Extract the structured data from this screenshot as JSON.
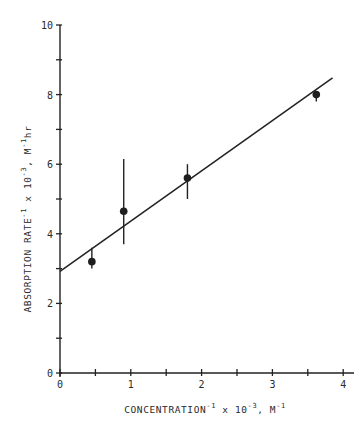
{
  "chart_data": {
    "type": "scatter",
    "title": "",
    "xlabel": {
      "main": "CONCENTRATION",
      "sup1": "-1",
      "mid": " x 10",
      "sup2": "-3",
      "unit": ", M",
      "sup3": "-1",
      "full": "CONCENTRATION^-1 x 10^-3, M^-1"
    },
    "ylabel": {
      "main": "ABSORPTION RATE",
      "sup1": "-1",
      "mid": " x 10",
      "sup2": "-3",
      "unit": ", M",
      "sup3": "-1",
      "tail": "hr",
      "full": "ABSORPTION RATE^-1 x 10^-3, M^-1 hr"
    },
    "xlim": [
      0,
      4.2
    ],
    "ylim": [
      0,
      10
    ],
    "x_ticks": [
      0,
      0.5,
      1,
      1.5,
      2,
      2.5,
      3,
      3.5,
      4
    ],
    "x_tick_labels": [
      "0",
      "1",
      "2",
      "3",
      "4"
    ],
    "y_ticks": [
      0,
      1,
      2,
      3,
      4,
      5,
      6,
      7,
      8,
      9,
      10
    ],
    "y_tick_labels": [
      "0",
      "2",
      "4",
      "6",
      "8",
      "10"
    ],
    "grid": false,
    "legend": null,
    "series": [
      {
        "name": "data",
        "points": [
          {
            "x": 0.45,
            "y": 3.2,
            "err_low": 3.0,
            "err_high": 3.6
          },
          {
            "x": 0.9,
            "y": 4.65,
            "err_low": 3.7,
            "err_high": 6.15
          },
          {
            "x": 1.8,
            "y": 5.6,
            "err_low": 5.0,
            "err_high": 6.0
          },
          {
            "x": 3.62,
            "y": 8.0,
            "err_low": 7.8,
            "err_high": 8.1
          }
        ]
      },
      {
        "name": "linear fit",
        "type": "line",
        "points": [
          {
            "x": 0,
            "y": 2.92
          },
          {
            "x": 3.85,
            "y": 8.48
          }
        ]
      }
    ]
  }
}
